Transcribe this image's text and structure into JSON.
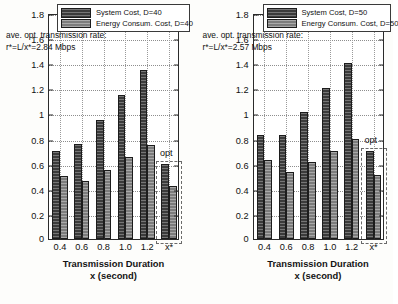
{
  "chart_data": [
    {
      "type": "bar",
      "id": "panel-d40",
      "title": "",
      "xlabel": "Transmission Duration x (second)",
      "xlabel_line1": "Transmission Duration",
      "xlabel_line2": "x (second)",
      "ylabel": "Ave. Total System Cost and Total Energy Cost",
      "categories": [
        "0.4",
        "0.6",
        "0.8",
        "1.0",
        "1.2",
        "x*"
      ],
      "series": [
        {
          "name": "System Cost, D=40",
          "values": [
            0.7,
            0.76,
            0.95,
            1.15,
            1.35,
            0.6
          ],
          "color": "#3b3b3b"
        },
        {
          "name": "Energy Consum. Cost, D=40",
          "values": [
            0.5,
            0.46,
            0.55,
            0.65,
            0.75,
            0.42
          ],
          "color": "#7c7c7c"
        }
      ],
      "ylim": [
        0,
        1.8
      ],
      "yticks": [
        "0.2",
        "0.4",
        "0.6",
        "0.8",
        "1",
        "1.2",
        "1.4",
        "1.6",
        "1.8"
      ],
      "ytick_values": [
        0.2,
        0.4,
        0.6,
        0.8,
        1.0,
        1.2,
        1.4,
        1.6,
        1.8
      ],
      "zero_label": "0",
      "grid": true,
      "legend_position": "top-center",
      "annotation_line1": "ave. opt. transmission rate:",
      "annotation_line2": "r*=L/x*=2.84 Mbps",
      "opt_label": "opt",
      "opt_category": "x*"
    },
    {
      "type": "bar",
      "id": "panel-d50",
      "title": "",
      "xlabel": "Transmission Duration x (second)",
      "xlabel_line1": "Transmission Duration",
      "xlabel_line2": "x (second)",
      "ylabel": "Ave. Total System Cost and Total Energy Cost",
      "categories": [
        "0.4",
        "0.6",
        "0.8",
        "1.0",
        "1.2",
        "x*"
      ],
      "series": [
        {
          "name": "System Cost, D=50",
          "values": [
            0.83,
            0.83,
            1.01,
            1.2,
            1.4,
            0.7
          ],
          "color": "#3b3b3b"
        },
        {
          "name": "Energy Consum. Cost, D=50",
          "values": [
            0.63,
            0.53,
            0.61,
            0.7,
            0.8,
            0.51
          ],
          "color": "#7c7c7c"
        }
      ],
      "ylim": [
        0,
        1.8
      ],
      "yticks": [
        "0.2",
        "0.4",
        "0.6",
        "0.8",
        "1",
        "1.2",
        "1.4",
        "1.6",
        "1.8"
      ],
      "ytick_values": [
        0.2,
        0.4,
        0.6,
        0.8,
        1.0,
        1.2,
        1.4,
        1.6,
        1.8
      ],
      "zero_label": "0",
      "grid": true,
      "legend_position": "top-center",
      "annotation_line1": "ave. opt. transmission rate:",
      "annotation_line2": "r*=L/x*=2.57 Mbps",
      "opt_label": "opt",
      "opt_category": "x*"
    }
  ]
}
